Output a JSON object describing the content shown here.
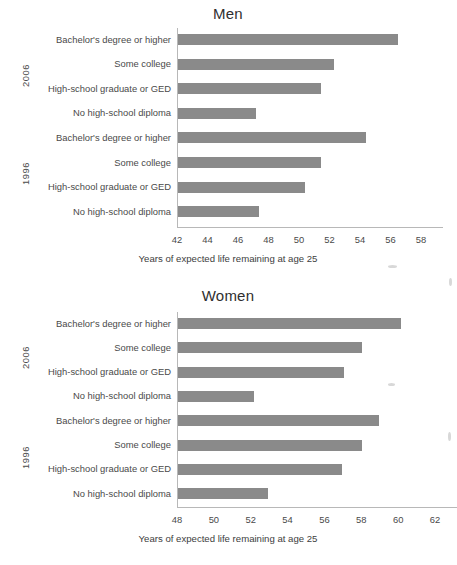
{
  "chart_data": [
    {
      "type": "bar",
      "orientation": "horizontal",
      "title": "Men",
      "xlabel": "Years of expected life remaining at age 25",
      "ylabel": "",
      "xlim": [
        42,
        58
      ],
      "xticks": [
        42,
        44,
        46,
        48,
        50,
        52,
        54,
        56,
        58
      ],
      "grid": false,
      "legend": null,
      "bar_color": "#8a8a8a",
      "group_labels": [
        "2006",
        "1996"
      ],
      "categories": [
        "Bachelor's degree or higher",
        "Some college",
        "High-school graduate or GED",
        "No high-school diploma",
        "Bachelor's degree or higher",
        "Some college",
        "High-school graduate or GED",
        "No high-school diploma"
      ],
      "groups": [
        "2006",
        "2006",
        "2006",
        "2006",
        "1996",
        "1996",
        "1996",
        "1996"
      ],
      "values": [
        56.4,
        52.2,
        51.4,
        47.1,
        54.3,
        51.4,
        50.3,
        47.3
      ]
    },
    {
      "type": "bar",
      "orientation": "horizontal",
      "title": "Women",
      "xlabel": "Years of expected life remaining at age 25",
      "ylabel": "",
      "xlim": [
        48,
        62
      ],
      "xticks": [
        48,
        50,
        52,
        54,
        56,
        58,
        60,
        62
      ],
      "grid": false,
      "legend": null,
      "bar_color": "#8a8a8a",
      "group_labels": [
        "2006",
        "1996"
      ],
      "categories": [
        "Bachelor's degree or higher",
        "Some college",
        "High-school graduate or GED",
        "No high-school diploma",
        "Bachelor's degree or higher",
        "Some college",
        "High-school graduate or GED",
        "No high-school diploma"
      ],
      "groups": [
        "2006",
        "2006",
        "2006",
        "2006",
        "1996",
        "1996",
        "1996",
        "1996"
      ],
      "values": [
        60.1,
        58.0,
        57.0,
        52.1,
        58.9,
        58.0,
        56.9,
        52.9
      ]
    }
  ],
  "men": {
    "title": "Men",
    "axis_title": "Years of expected life remaining at age 25",
    "year_2006": "2006",
    "year_1996": "1996",
    "ticks": [
      "42",
      "44",
      "46",
      "48",
      "50",
      "52",
      "54",
      "56",
      "58"
    ],
    "bars": [
      {
        "label": "Bachelor's degree or higher",
        "value": 56.4
      },
      {
        "label": "Some college",
        "value": 52.2
      },
      {
        "label": "High-school graduate or GED",
        "value": 51.4
      },
      {
        "label": "No high-school diploma",
        "value": 47.1
      },
      {
        "label": "Bachelor's degree or higher",
        "value": 54.3
      },
      {
        "label": "Some college",
        "value": 51.4
      },
      {
        "label": "High-school graduate or GED",
        "value": 50.3
      },
      {
        "label": "No high-school diploma",
        "value": 47.3
      }
    ]
  },
  "women": {
    "title": "Women",
    "axis_title": "Years of expected life remaining at age 25",
    "year_2006": "2006",
    "year_1996": "1996",
    "ticks": [
      "48",
      "50",
      "52",
      "54",
      "56",
      "58",
      "60",
      "62"
    ],
    "bars": [
      {
        "label": "Bachelor's degree or higher",
        "value": 60.1
      },
      {
        "label": "Some college",
        "value": 58.0
      },
      {
        "label": "High-school graduate or GED",
        "value": 57.0
      },
      {
        "label": "No high-school diploma",
        "value": 52.1
      },
      {
        "label": "Bachelor's degree or higher",
        "value": 58.9
      },
      {
        "label": "Some college",
        "value": 58.0
      },
      {
        "label": "High-school graduate or GED",
        "value": 56.9
      },
      {
        "label": "No high-school diploma",
        "value": 52.9
      }
    ]
  }
}
